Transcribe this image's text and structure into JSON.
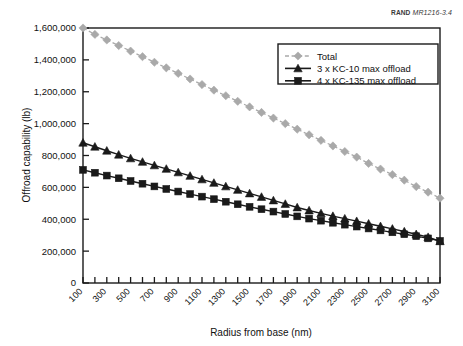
{
  "credit": {
    "org": "RAND",
    "document": "MR1216-3.4"
  },
  "chart_data": {
    "type": "line",
    "title": "",
    "xlabel": "Radius from base (nm)",
    "ylabel": "Offroad capability (lb)",
    "xlim": [
      100,
      3100
    ],
    "ylim": [
      0,
      1600000
    ],
    "grid": false,
    "legend_position": "top-right",
    "x": [
      100,
      200,
      300,
      400,
      500,
      600,
      700,
      800,
      900,
      1000,
      1100,
      1200,
      1300,
      1400,
      1500,
      1600,
      1700,
      1800,
      1900,
      2000,
      2100,
      2200,
      2300,
      2400,
      2500,
      2600,
      2700,
      2800,
      2900,
      3000,
      3100
    ],
    "xticks": [
      100,
      200,
      300,
      400,
      500,
      600,
      700,
      800,
      900,
      1000,
      1100,
      1200,
      1300,
      1400,
      1500,
      1600,
      1700,
      1800,
      1900,
      2000,
      2100,
      2200,
      2300,
      2400,
      2500,
      2600,
      2700,
      2800,
      2900,
      3000,
      3100
    ],
    "xticklabels": [
      "100",
      "",
      "300",
      "",
      "500",
      "",
      "700",
      "",
      "900",
      "",
      "1100",
      "",
      "1300",
      "",
      "1500",
      "",
      "1700",
      "",
      "1900",
      "",
      "2100",
      "",
      "2300",
      "",
      "2500",
      "",
      "2700",
      "",
      "2900",
      "",
      "3100"
    ],
    "yticks": [
      0,
      200000,
      400000,
      600000,
      800000,
      1000000,
      1200000,
      1400000,
      1600000
    ],
    "yticklabels": [
      "0",
      "200,000",
      "400,000",
      "600,000",
      "800,000",
      "1,000,000",
      "1,200,000",
      "1,400,000",
      "1,600,000"
    ],
    "series": [
      {
        "name": "Total",
        "color": "#a9a9a9",
        "marker": "diamond",
        "linestyle": "dashed",
        "values": [
          1600000,
          1560000,
          1525000,
          1490000,
          1455000,
          1420000,
          1385000,
          1350000,
          1315000,
          1280000,
          1245000,
          1210000,
          1175000,
          1140000,
          1105000,
          1070000,
          1035000,
          1000000,
          965000,
          930000,
          895000,
          860000,
          825000,
          790000,
          750000,
          715000,
          680000,
          645000,
          605000,
          570000,
          532000
        ]
      },
      {
        "name": "3 x KC-10 max offload",
        "color": "#1a1a1a",
        "marker": "triangle",
        "linestyle": "solid",
        "values": [
          880000,
          855000,
          830000,
          805000,
          782000,
          760000,
          738000,
          716000,
          694000,
          672000,
          650000,
          628000,
          606000,
          584000,
          562000,
          540000,
          518000,
          496000,
          474000,
          455000,
          437000,
          420000,
          404000,
          388000,
          372000,
          356000,
          340000,
          323000,
          306000,
          288000,
          262000
        ]
      },
      {
        "name": "4 x KC-135 max offload",
        "color": "#1a1a1a",
        "marker": "square",
        "linestyle": "solid",
        "values": [
          710000,
          692000,
          674000,
          657000,
          640000,
          623000,
          606000,
          590000,
          574000,
          558000,
          542000,
          526000,
          510000,
          494000,
          478000,
          463000,
          448000,
          433000,
          418000,
          404000,
          391000,
          378000,
          366000,
          354000,
          342000,
          330000,
          318000,
          306000,
          294000,
          280000,
          264000
        ]
      }
    ]
  }
}
